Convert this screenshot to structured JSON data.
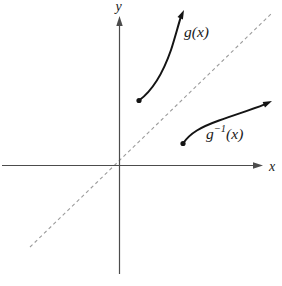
{
  "figure": {
    "colors": {
      "background": "#ffffff",
      "axis": "#4c4c4c",
      "curve": "#141414",
      "dashed": "#9c9c9c",
      "text": "#1a1a1a"
    },
    "axes": {
      "x_label": "x",
      "y_label": "y"
    },
    "curves": {
      "g": {
        "label": "g(x)"
      },
      "g_inverse": {
        "label_base": "g",
        "label_sup": "−1",
        "label_arg": "(x)"
      }
    }
  }
}
